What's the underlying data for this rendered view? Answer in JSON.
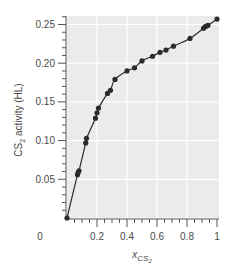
{
  "chart_data": {
    "type": "line",
    "title": "",
    "xlabel": "x_CS2",
    "xlabel_main": "x",
    "xlabel_sub": "CS",
    "xlabel_subsub": "2",
    "ylabel": "CS2 activity (HL)",
    "ylabel_main": "CS",
    "ylabel_sub": "2",
    "ylabel_rest": " activity (HL)",
    "xlim": [
      0,
      1
    ],
    "ylim": [
      0,
      0.26
    ],
    "x_ticks": [
      0,
      0.2,
      0.4,
      0.6,
      0.8,
      1
    ],
    "x_tick_labels": [
      "0",
      "0.2",
      "0.4",
      "0.6",
      "0.8",
      "1"
    ],
    "y_ticks": [
      0.05,
      0.1,
      0.15,
      0.2,
      0.25
    ],
    "y_tick_labels": [
      "0.05",
      "0.10",
      "0.15",
      "0.20",
      "0.25"
    ],
    "grid": true,
    "legend": null,
    "series": [
      {
        "name": "CS2 activity",
        "marker": "circle",
        "line": true,
        "color": "#2b2b2b",
        "x": [
          0.0,
          0.07,
          0.075,
          0.08,
          0.125,
          0.13,
          0.19,
          0.2,
          0.21,
          0.27,
          0.29,
          0.32,
          0.4,
          0.45,
          0.5,
          0.57,
          0.62,
          0.66,
          0.71,
          0.82,
          0.91,
          0.92,
          0.93,
          0.94,
          1.0
        ],
        "y": [
          0.0,
          0.056,
          0.059,
          0.061,
          0.097,
          0.103,
          0.129,
          0.136,
          0.142,
          0.161,
          0.165,
          0.179,
          0.19,
          0.194,
          0.203,
          0.209,
          0.214,
          0.217,
          0.222,
          0.232,
          0.245,
          0.247,
          0.248,
          0.249,
          0.257
        ]
      }
    ]
  },
  "colors": {
    "panel_bg": "#ebebeb",
    "grid": "#ffffff",
    "axis": "#555555",
    "text": "#4a4a4a",
    "series": "#2b2b2b"
  }
}
